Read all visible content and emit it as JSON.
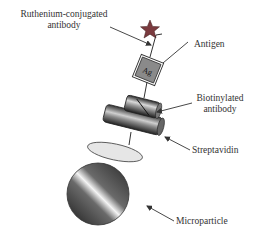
{
  "diagram": {
    "labels": {
      "ruthenium_line1": "Ruthenium-conjugated",
      "ruthenium_line2": "antibody",
      "antigen": "Antigen",
      "antigen_abbrev": "Ag",
      "biotinylated_line1": "Biotinylated",
      "biotinylated_line2": "antibody",
      "streptavidin": "Streptavidin",
      "microparticle": "Microparticle"
    },
    "colors": {
      "star": "#7a3a3e",
      "antigen_fill": "#8a8a8a",
      "line": "#333333",
      "streptavidin_fill": "#e6e6e6"
    }
  }
}
